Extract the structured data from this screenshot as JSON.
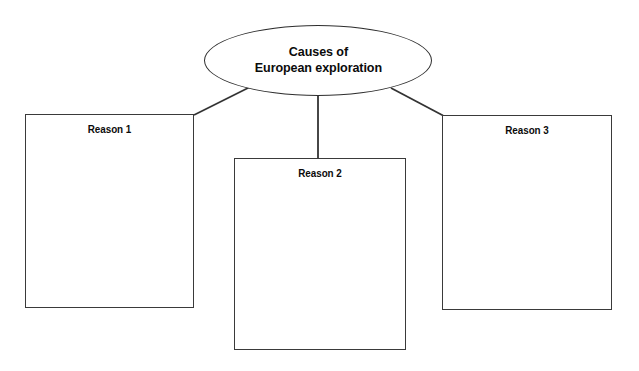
{
  "diagram": {
    "type": "graphic-organizer",
    "background_color": "#ffffff",
    "stroke_color": "#333333",
    "text_color": "#0b0b0b",
    "center": {
      "shape": "ellipse",
      "title": "Causes of\nEuropean exploration",
      "title_line_1": "Causes of",
      "title_line_2": "European exploration"
    },
    "boxes": [
      {
        "label": "Reason 1",
        "content": ""
      },
      {
        "label": "Reason 2",
        "content": ""
      },
      {
        "label": "Reason 3",
        "content": ""
      }
    ],
    "connectors": [
      {
        "name": "center-to-reason-1",
        "style": "diagonal"
      },
      {
        "name": "center-to-reason-2",
        "style": "vertical"
      },
      {
        "name": "center-to-reason-3",
        "style": "diagonal"
      }
    ]
  }
}
